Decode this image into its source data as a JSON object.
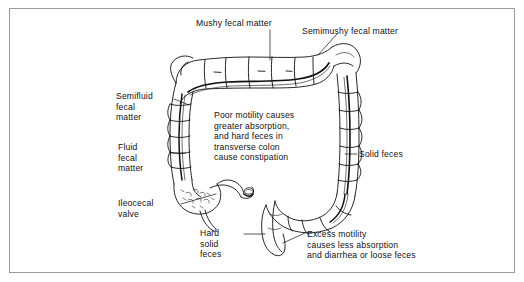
{
  "figure": {
    "border_color": "#9a9a9a",
    "background_color": "#ffffff",
    "ink_color": "#101010"
  },
  "annotations": {
    "mushy": "Mushy fecal matter",
    "semimushy": "Semimushy fecal matter",
    "semifluid": "Semifluid\nfecal\nmatter",
    "fluid": "Fluid\nfecal\nmatter",
    "ileocecal": "Ileocecal\nvalve",
    "poor_motility": "Poor motility causes\ngreater absorption,\nand hard feces in\ntransverse colon\ncause constipation",
    "solid_feces": "Solid feces",
    "hard_solid": "Hard\nsolid\nfeces",
    "excess_motility": "Excess motility\ncauses less absorption\nand diarrhea or loose feces"
  },
  "anatomy": {
    "parts": [
      "transverse-colon",
      "ascending-colon",
      "descending-colon",
      "hepatic-flexure",
      "splenic-flexure",
      "cecum",
      "ileocecal-valve",
      "appendix",
      "sigmoid-colon",
      "rectum"
    ]
  }
}
